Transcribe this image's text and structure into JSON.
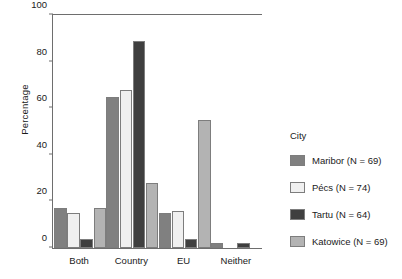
{
  "chart_data": {
    "type": "bar",
    "title": "",
    "xlabel": "",
    "ylabel": "Percentage",
    "ylim": [
      0,
      100
    ],
    "yticks": [
      0,
      20,
      40,
      60,
      80,
      100
    ],
    "grid": false,
    "legend_position": "right",
    "legend_title": "City",
    "categories": [
      "Both",
      "Country",
      "EU",
      "Neither"
    ],
    "series": [
      {
        "name": "Maribor (N = 69)",
        "color": "#808080",
        "values": [
          17,
          65,
          15,
          2
        ]
      },
      {
        "name": "Pécs (N = 74)",
        "color": "#f0f0f0",
        "values": [
          15,
          68,
          16,
          0
        ]
      },
      {
        "name": "Tartu (N = 64)",
        "color": "#3f3f3f",
        "values": [
          4,
          89,
          4,
          2
        ]
      },
      {
        "name": "Katowice (N = 69)",
        "color": "#b3b3b3",
        "values": [
          17,
          28,
          55,
          0
        ]
      }
    ]
  },
  "axis": {
    "tick_labels": [
      "0",
      "20",
      "40",
      "60",
      "80",
      "100"
    ]
  },
  "legend": {
    "title": "City",
    "items": [
      {
        "label": "Maribor (N = 69)"
      },
      {
        "label": "Pécs (N = 74)"
      },
      {
        "label": "Tartu (N = 64)"
      },
      {
        "label": "Katowice (N = 69)"
      }
    ]
  }
}
